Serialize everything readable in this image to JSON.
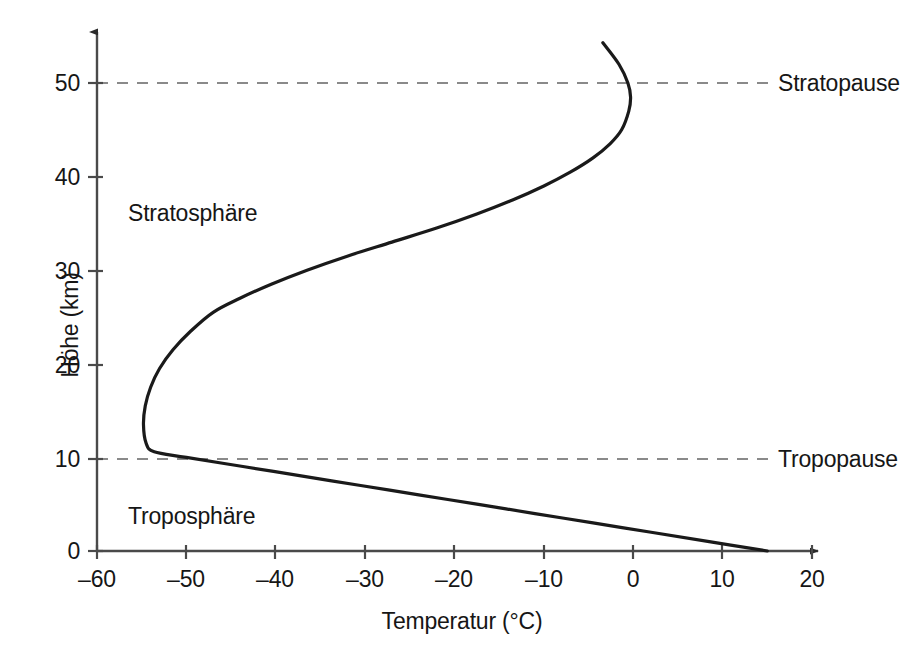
{
  "chart_data": {
    "type": "line",
    "title": "",
    "xlabel": "Temperatur (°C)",
    "ylabel": "Höhe (km)",
    "xlim": [
      -60,
      20
    ],
    "ylim": [
      0,
      55
    ],
    "xticks": [
      "–60",
      "–50",
      "–40",
      "–30",
      "–20",
      "–10",
      "0",
      "10",
      "20"
    ],
    "xtick_values": [
      -60,
      -50,
      -40,
      -30,
      -20,
      -10,
      0,
      10,
      20
    ],
    "yticks": [
      "0",
      "10",
      "20",
      "30",
      "40",
      "50"
    ],
    "ytick_values": [
      0,
      10,
      20,
      30,
      40,
      50
    ],
    "grid": false,
    "legend": "none",
    "series": [
      {
        "name": "Temperaturprofil",
        "x": [
          15.0,
          8.5,
          2.0,
          -4.5,
          -11.0,
          -17.5,
          -24.0,
          -30.5,
          -37.0,
          -43.5,
          -50.0,
          -53.6,
          -54.5,
          -54.8,
          -54.6,
          -54.0,
          -53.0,
          -51.5,
          -49.5,
          -47.0,
          -44.0,
          -40.5,
          -36.5,
          -32.0,
          -27.0,
          -22.0,
          -17.5,
          -13.5,
          -10.0,
          -7.0,
          -4.5,
          -2.6,
          -1.3,
          -0.5,
          -0.3,
          -0.6,
          -1.6,
          -3.4
        ],
        "y": [
          0.0,
          1.0,
          2.0,
          3.0,
          4.0,
          5.0,
          6.0,
          7.0,
          8.0,
          9.0,
          10.0,
          10.6,
          11.5,
          13.5,
          15.5,
          17.5,
          19.5,
          21.5,
          23.5,
          25.5,
          27.0,
          28.5,
          30.0,
          31.5,
          33.0,
          34.5,
          36.0,
          37.5,
          39.0,
          40.5,
          42.0,
          43.5,
          45.0,
          47.0,
          48.5,
          50.0,
          52.0,
          54.3
        ],
        "color": "#1a1a1a"
      }
    ],
    "annotations": [
      {
        "name": "stratosphere-layer-label",
        "text": "Stratosphäre",
        "x": -56,
        "y": 36
      },
      {
        "name": "troposphere-layer-label",
        "text": "Troposphäre",
        "x": -56,
        "y": 4.5
      }
    ],
    "boundaries": [
      {
        "name": "stratopause",
        "label": "Stratopause",
        "y": 50,
        "style": "dashed"
      },
      {
        "name": "tropopause",
        "label": "Tropopause",
        "y": 10,
        "style": "dashed"
      }
    ]
  },
  "axes": {
    "x_title": "Temperatur (°C)",
    "y_title": "Höhe (km)",
    "x_tick_labels": [
      "–60",
      "–50",
      "–40",
      "–30",
      "–20",
      "–10",
      "0",
      "10",
      "20"
    ],
    "y_tick_labels": [
      "0",
      "10",
      "20",
      "30",
      "40",
      "50"
    ]
  },
  "labels": {
    "stratosphere": "Stratosphäre",
    "troposphere": "Troposphäre",
    "stratopause": "Stratopause",
    "tropopause": "Tropopause"
  },
  "colors": {
    "curve": "#1a1a1a",
    "axis": "#4a4a4a",
    "dashed": "#8a8a8a",
    "text": "#161616",
    "background": "#ffffff"
  }
}
